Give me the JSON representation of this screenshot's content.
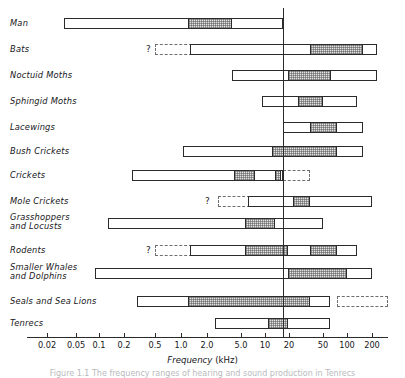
{
  "figure": {
    "axis_title_main": "Frequency",
    "axis_title_unit": "(kHz)",
    "vline_label": "20",
    "caption_fragment": "Figure 1.1 The frequency ranges of hearing and sound production in Tenrecs"
  },
  "chart_data": {
    "type": "bar",
    "title": "Frequency ranges of hearing and sound production",
    "xlabel": "Frequency (kHz)",
    "ylabel": "",
    "orientation": "horizontal",
    "xscale": "log-segmented",
    "grid": false,
    "legend": null,
    "axis_ticks": [
      {
        "label": "0.02",
        "px": 47
      },
      {
        "label": "0.05",
        "px": 76
      },
      {
        "label": "0.1",
        "px": 99
      },
      {
        "label": "0.2",
        "px": 124
      },
      {
        "label": "0.5",
        "px": 155
      },
      {
        "label": "1.0",
        "px": 181
      },
      {
        "label": "2.0",
        "px": 207
      },
      {
        "label": "5.0",
        "px": 241
      },
      {
        "label": "10",
        "px": 265
      },
      {
        "label": "20",
        "px": 289
      },
      {
        "label": "50",
        "px": 323
      },
      {
        "label": "100",
        "px": 347
      },
      {
        "label": "200",
        "px": 372
      }
    ],
    "axis_start_px": 27,
    "axis_end_px": 388,
    "reference_line_px": 283,
    "categories": [
      "Man",
      "Bats",
      "Noctuid Moths",
      "Sphingid Moths",
      "Lacewings",
      "Bush Crickets",
      "Crickets",
      "Mole Crickets",
      "Grasshoppers and Locusts",
      "Rodents",
      "Smaller Whales and Dolphins",
      "Seals and Sea Lions",
      "Tenrecs"
    ],
    "series": [
      {
        "name": "Man",
        "label_lines": [
          "Man"
        ],
        "bar": {
          "x1": 64,
          "x2": 283
        },
        "segments": [
          {
            "x1": 188,
            "x2": 232
          }
        ],
        "dashed": null,
        "question_mark": false
      },
      {
        "name": "Bats",
        "label_lines": [
          "Bats"
        ],
        "bar": {
          "x1": 190,
          "x2": 377
        },
        "segments": [
          {
            "x1": 310,
            "x2": 363
          }
        ],
        "dashed": {
          "x1": 155,
          "x2": 192
        },
        "question_mark": true,
        "qx": 146
      },
      {
        "name": "Noctuid Moths",
        "label_lines": [
          "Noctuid  Moths"
        ],
        "bar": {
          "x1": 232,
          "x2": 377
        },
        "segments": [
          {
            "x1": 288,
            "x2": 331
          }
        ],
        "dashed": null,
        "question_mark": false
      },
      {
        "name": "Sphingid Moths",
        "label_lines": [
          "Sphingid  Moths"
        ],
        "bar": {
          "x1": 262,
          "x2": 357
        },
        "segments": [
          {
            "x1": 298,
            "x2": 323
          }
        ],
        "dashed": null,
        "question_mark": false
      },
      {
        "name": "Lacewings",
        "label_lines": [
          "Lacewings"
        ],
        "bar": {
          "x1": 283,
          "x2": 363
        },
        "segments": [
          {
            "x1": 310,
            "x2": 337
          }
        ],
        "dashed": null,
        "question_mark": false
      },
      {
        "name": "Bush Crickets",
        "label_lines": [
          "Bush  Crickets"
        ],
        "bar": {
          "x1": 183,
          "x2": 363
        },
        "segments": [
          {
            "x1": 272,
            "x2": 337
          }
        ],
        "dashed": null,
        "question_mark": false
      },
      {
        "name": "Crickets",
        "label_lines": [
          "Crickets"
        ],
        "bar": {
          "x1": 132,
          "x2": 283
        },
        "segments": [
          {
            "x1": 234,
            "x2": 255
          },
          {
            "x1": 275,
            "x2": 281
          }
        ],
        "dashed": {
          "x1": 283,
          "x2": 310
        },
        "question_mark": false
      },
      {
        "name": "Mole Crickets",
        "label_lines": [
          "Mole  Crickets"
        ],
        "bar": {
          "x1": 248,
          "x2": 372
        },
        "segments": [
          {
            "x1": 293,
            "x2": 310
          }
        ],
        "dashed": {
          "x1": 218,
          "x2": 250
        },
        "question_mark": true,
        "qx": 205
      },
      {
        "name": "Grasshoppers and Locusts",
        "label_lines": [
          "Grasshoppers",
          "and  Locusts"
        ],
        "bar": {
          "x1": 108,
          "x2": 323
        },
        "segments": [
          {
            "x1": 245,
            "x2": 275
          }
        ],
        "dashed": null,
        "question_mark": false
      },
      {
        "name": "Rodents",
        "label_lines": [
          "Rodents"
        ],
        "bar": {
          "x1": 190,
          "x2": 357
        },
        "segments": [
          {
            "x1": 245,
            "x2": 288
          },
          {
            "x1": 310,
            "x2": 337
          }
        ],
        "dashed": {
          "x1": 155,
          "x2": 192
        },
        "question_mark": true,
        "qx": 146
      },
      {
        "name": "Smaller Whales and Dolphins",
        "label_lines": [
          "Smaller  Whales",
          "and  Dolphins"
        ],
        "bar": {
          "x1": 95,
          "x2": 372
        },
        "segments": [
          {
            "x1": 288,
            "x2": 347
          }
        ],
        "dashed": null,
        "question_mark": false
      },
      {
        "name": "Seals and Sea Lions",
        "label_lines": [
          "Seals  and  Sea  Lions"
        ],
        "bar": {
          "x1": 137,
          "x2": 330
        },
        "segments": [
          {
            "x1": 188,
            "x2": 310
          }
        ],
        "dashed": {
          "x1": 337,
          "x2": 388
        },
        "question_mark": false
      },
      {
        "name": "Tenrecs",
        "label_lines": [
          "Tenrecs"
        ],
        "bar": {
          "x1": 215,
          "x2": 330
        },
        "segments": [
          {
            "x1": 268,
            "x2": 288
          }
        ],
        "dashed": null,
        "question_mark": false
      }
    ]
  }
}
